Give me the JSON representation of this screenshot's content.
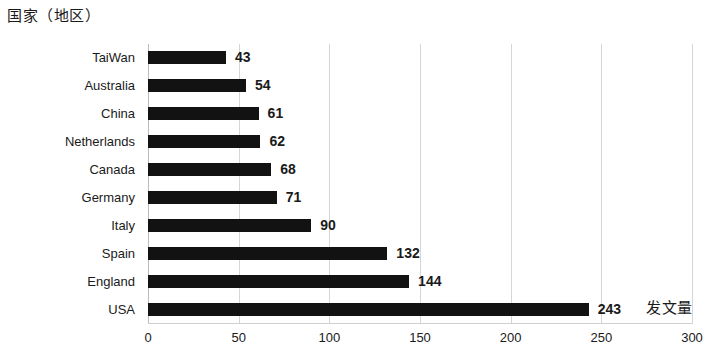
{
  "chart_data": {
    "type": "bar",
    "orientation": "horizontal",
    "title": "国家（地区）",
    "xlabel": "发文量",
    "ylabel": "",
    "categories": [
      "USA",
      "England",
      "Spain",
      "Italy",
      "Germany",
      "Canada",
      "Netherlands",
      "China",
      "Australia",
      "TaiWan"
    ],
    "values": [
      243,
      144,
      132,
      90,
      71,
      68,
      62,
      61,
      54,
      43
    ],
    "value_labels": [
      "243",
      "144",
      "132",
      "90",
      "71",
      "68",
      "62",
      "61",
      "54",
      "43"
    ],
    "xlim": [
      0,
      300
    ],
    "x_ticks": [
      0,
      50,
      100,
      150,
      200,
      250,
      300
    ],
    "x_tick_labels": [
      "0",
      "50",
      "100",
      "150",
      "200",
      "250",
      "300"
    ],
    "grid": true,
    "grid_axis": "x",
    "legend": false,
    "bar_color": "#121212",
    "grid_color": "#d6d6d6",
    "background_color": "#ffffff",
    "text_color": "#1a1a1a"
  }
}
